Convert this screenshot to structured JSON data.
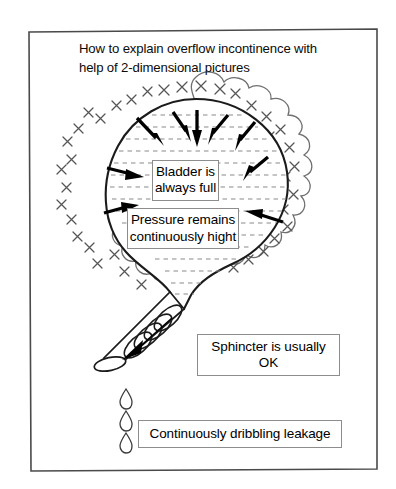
{
  "figure": {
    "title": "How to explain overflow incontinence with\nhelp of 2-dimensional pictures",
    "frame_color": "#4a4a4a",
    "ink_color": "#000000",
    "wall_color": "#6b6b6b",
    "labels": {
      "bladder": "Bladder is\nalways full",
      "pressure": "Pressure remains\ncontinuously hight",
      "sphincter": "Sphincter is usually\nOK",
      "leakage": "Continuously dribbling leakage"
    },
    "icons": {
      "bladder_wall": "scalloped-bladder-wall-icon",
      "hatch_marks": "x-hatch-marks-icon",
      "fluid_lines": "dashed-fluid-lines-icon",
      "pressure_arrows": "inward-pressure-arrows-icon",
      "urethra": "urethra-tube-icon",
      "sphincter_coil": "sphincter-coil-icon",
      "flow_arrow": "downward-flow-arrow-icon",
      "drops": "urine-drops-icon"
    },
    "counts": {
      "pressure_arrows": 10,
      "drops": 3,
      "sphincter_coils": 4
    }
  }
}
